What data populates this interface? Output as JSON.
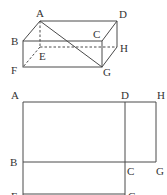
{
  "figure_top": {
    "type": "rectangular-prism",
    "labels": {
      "A": "A",
      "B": "B",
      "C": "C",
      "D": "D",
      "E": "E",
      "F": "F",
      "G": "G",
      "H": "H"
    },
    "diagonal": "AG"
  },
  "figure_bottom": {
    "type": "net",
    "labels": {
      "A": "A",
      "D": "D",
      "H": "H",
      "B": "B",
      "C": "C",
      "G": "G",
      "F": "F",
      "G2": "G"
    }
  },
  "colors": {
    "line": "#4a4a4a",
    "text": "#333333",
    "background": "#ffffff"
  }
}
